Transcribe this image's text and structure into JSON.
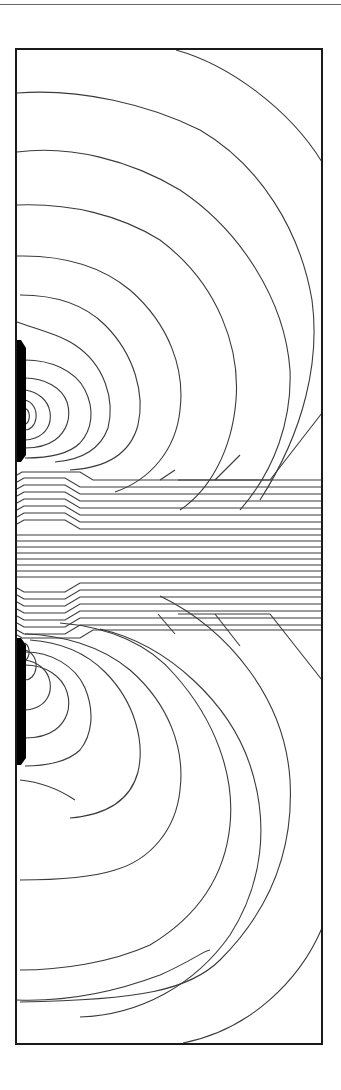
{
  "figure": {
    "type": "equipotential-contour-plot",
    "frame": {
      "x": 16,
      "y": 49,
      "width": 306,
      "height": 995,
      "stroke": "#1a1a1a"
    },
    "line_color": "#3a3a3a",
    "background": "#ffffff",
    "electrodes": [
      {
        "name": "upper-electrode",
        "x": 16,
        "y": 340,
        "width": 9,
        "height": 122,
        "color": "#000000"
      },
      {
        "name": "lower-electrode",
        "x": 16,
        "y": 638,
        "width": 9,
        "height": 127,
        "color": "#000000"
      }
    ],
    "channel": {
      "y_start": 485,
      "y_end": 615,
      "straight_lines": 10,
      "bent_lines_upper": 7,
      "bent_lines_lower": 7
    }
  }
}
